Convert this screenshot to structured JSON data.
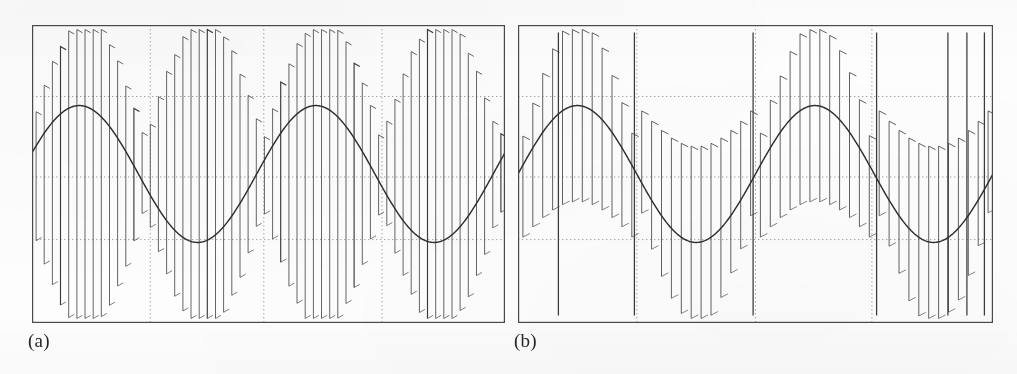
{
  "figure": {
    "kind": "two-panel-waveform-figure",
    "background_color": "#fdfdfd",
    "ink_color": "#3a3a3a",
    "grid_color": "#9a9a9a",
    "frame_color": "#4a4a4a",
    "width": 1017,
    "height": 374
  },
  "panels": [
    {
      "id": "a",
      "caption": "(a)",
      "frame": {
        "x": 32,
        "y": 25,
        "width": 473,
        "height": 298
      },
      "grid": {
        "vertical_fractions": [
          0.25,
          0.49,
          0.74
        ],
        "horizontal_fractions": [
          0.24,
          0.51,
          0.72
        ],
        "style": "dotted"
      }
    },
    {
      "id": "b",
      "caption": "(b)",
      "frame": {
        "x": 518,
        "y": 25,
        "width": 475,
        "height": 298
      },
      "grid": {
        "vertical_fractions": [
          0.25,
          0.5,
          0.745
        ],
        "horizontal_fractions": [
          0.24,
          0.51,
          0.72
        ],
        "style": "dotted"
      }
    }
  ],
  "chart_data": [
    {
      "type": "line",
      "panel": "a",
      "title": "(a)",
      "xlabel": "",
      "ylabel": "",
      "xlim": [
        0,
        1
      ],
      "ylim": [
        -1.35,
        1.35
      ],
      "grid": true,
      "legend": "none",
      "annotations": [
        "(a)"
      ],
      "series": [
        {
          "name": "modulating-sine-reference",
          "role": "reference-sine",
          "kind": "sine",
          "amplitude": 0.62,
          "cycles": 2.0,
          "phase_deg": 18,
          "offset": 0.0,
          "description": "Smooth sinusoidal modulating reference, about two full cycles across the frame."
        },
        {
          "name": "pwm-pulse-train",
          "role": "switched-output",
          "kind": "pwm-vertical-pulses",
          "carrier_pulses": 58,
          "envelope": "rectified-double-frequency",
          "envelope_amplitude": 1.2,
          "envelope_cycles": 4.0,
          "notch_count": 3,
          "description": "Dense vertical switching edges whose upper and lower envelopes form a folded (rectified) double-frequency pattern with notches where the envelope folds."
        }
      ]
    },
    {
      "type": "line",
      "panel": "b",
      "title": "(b)",
      "xlabel": "",
      "ylabel": "",
      "xlim": [
        0,
        1
      ],
      "ylim": [
        -1.35,
        1.35
      ],
      "grid": true,
      "legend": "none",
      "annotations": [
        "(b)"
      ],
      "series": [
        {
          "name": "modulating-sine-reference",
          "role": "reference-sine",
          "kind": "sine",
          "amplitude": 0.62,
          "cycles": 2.0,
          "phase_deg": 0,
          "offset": 0.0,
          "description": "Smooth sinusoidal modulating reference, about two full cycles across the frame, starting at zero and rising."
        },
        {
          "name": "pwm-pulse-train",
          "role": "switched-output",
          "kind": "pwm-vertical-pulses",
          "carrier_pulses": 48,
          "envelope": "sine-following-bipolar",
          "envelope_amplitude": 1.2,
          "envelope_cycles": 2.0,
          "full_height_spike_count": 6,
          "description": "Vertical switching edges that follow the sine directly: pulses ride above the reference in the positive half-cycle and below it in the negative half, with full-height spikes at the zero crossings and at the right edge."
        }
      ]
    }
  ]
}
